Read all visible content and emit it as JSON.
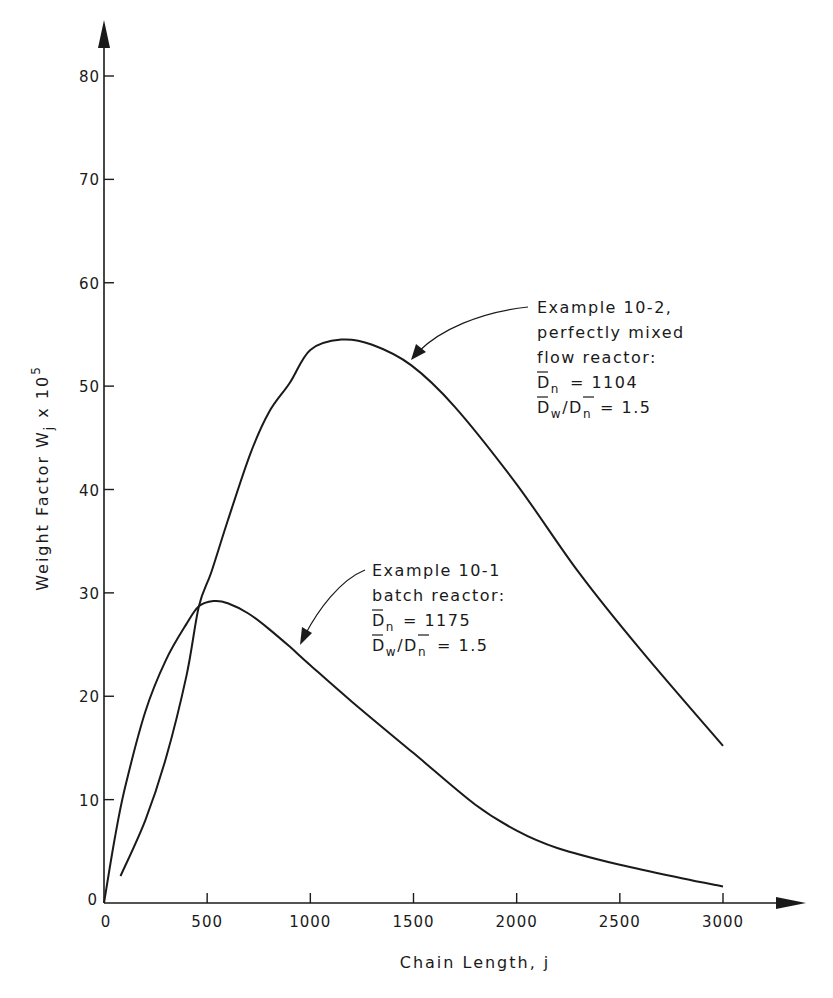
{
  "chart_data": {
    "type": "line",
    "title": "",
    "xlabel": "Chain Length, j",
    "ylabel": "Weight Factor W_j x 10^5",
    "ylabel_parts": {
      "main": "Weight Factor  W",
      "sub": "j",
      "mid": " x 10",
      "sup": "5"
    },
    "xlim": [
      0,
      3000
    ],
    "ylim": [
      0,
      80
    ],
    "grid": false,
    "legend": "none (inline annotations)",
    "x_ticks": [
      0,
      500,
      1000,
      1500,
      2000,
      2500,
      3000
    ],
    "x_tick_labels": [
      "0",
      "500",
      "1000",
      "1500",
      "2000",
      "2500",
      "3000"
    ],
    "y_ticks": [
      0,
      10,
      20,
      30,
      40,
      50,
      60,
      70,
      80
    ],
    "y_tick_labels": [
      "0",
      "10",
      "20",
      "30",
      "40",
      "50",
      "60",
      "70",
      "80"
    ],
    "series": [
      {
        "name": "Example 10-1, batch reactor",
        "x": [
          0,
          50,
          100,
          200,
          300,
          400,
          460,
          530,
          600,
          700,
          800,
          900,
          1000,
          1200,
          1500,
          1800,
          2000,
          2200,
          2500,
          2800,
          3000
        ],
        "values": [
          0,
          6,
          11,
          18.5,
          23.5,
          27,
          28.7,
          29.2,
          29.0,
          28.0,
          26.5,
          24.8,
          23.0,
          19.5,
          14.5,
          9.5,
          7.0,
          5.3,
          3.7,
          2.4,
          1.6
        ],
        "annotation": [
          "Example 10-1",
          "batch reactor:",
          "D̄n = 1175",
          "D̄w/D̄n = 1.5"
        ]
      },
      {
        "name": "Example 10-2, perfectly mixed flow reactor",
        "x": [
          80,
          200,
          300,
          400,
          460,
          520,
          600,
          710,
          800,
          900,
          1000,
          1150,
          1300,
          1490,
          1700,
          2000,
          2300,
          2600,
          3000
        ],
        "values": [
          2.6,
          8,
          14,
          22,
          28.7,
          32,
          37,
          43.5,
          47.5,
          50.3,
          53.5,
          54.5,
          54.0,
          52.0,
          48.0,
          40.5,
          32.0,
          24.5,
          15.2
        ],
        "annotation": [
          "Example 10-2,",
          "perfectly mixed",
          "flow reactor:",
          "D̄n = 1104",
          "D̄w/D̄n = 1.5"
        ]
      }
    ]
  },
  "axes": {
    "x_title": "Chain Length, j",
    "y_title_main": "Weight Factor  W",
    "y_title_sub": "j",
    "y_title_mid": " x 10",
    "y_title_sup": "5",
    "origin_y_label": "0",
    "origin_x_label": "0"
  },
  "annotations": {
    "cstr": {
      "line1": "Example 10-2,",
      "line2": "perfectly mixed",
      "line3": "flow reactor:",
      "dn_symbol": "D",
      "dn_sub": "n",
      "dn_value": "= 1104",
      "ratio_w": "w",
      "ratio_n": "n",
      "ratio_value": "= 1.5"
    },
    "batch": {
      "line1": "Example 10-1",
      "line2": "batch reactor:",
      "dn_symbol": "D",
      "dn_sub": "n",
      "dn_value": "= 1175",
      "ratio_w": "w",
      "ratio_n": "n",
      "ratio_value": "= 1.5"
    }
  }
}
